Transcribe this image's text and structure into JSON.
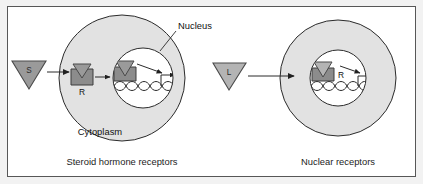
{
  "figure": {
    "background_color": "#ffffff",
    "frame_color": "#575757",
    "outer_margin_color": "#f2f2f2"
  },
  "colors": {
    "cytoplasm_fill": "#e2e2e2",
    "nucleus_fill": "#ffffff",
    "ligand_s_fill": "#9a9a9a",
    "ligand_l_fill": "#b4b4b4",
    "receptor_fill": "#8c8c8c",
    "outline": "#2b2b2b",
    "text": "#111111"
  },
  "panels": [
    {
      "id": "steroid-panel",
      "caption": "Steroid hormone receptors",
      "ligand": {
        "label": "S",
        "name": "steroid-hormone-ligand",
        "shape": "down-triangle",
        "fill": "#9a9a9a"
      },
      "cell": {
        "cytoplasm_label": "Cytoplasm",
        "nucleus_label": "Nucleus",
        "nucleus_leader_line": true
      },
      "cytoplasmic_receptor": {
        "label": "R",
        "name": "cytoplasmic-receptor",
        "bound": true
      },
      "nuclear_complex": {
        "label": "",
        "name": "nuclear-receptor-dna-complex",
        "bound_to_dna": true
      },
      "dna": {
        "name": "dna-double-helix",
        "turns": 5
      },
      "arrows": [
        {
          "name": "ligand-entry-arrow",
          "from": "ligand",
          "to": "cytoplasmic-receptor"
        },
        {
          "name": "translocation-arrow",
          "from": "cytoplasmic-receptor",
          "to": "nucleus"
        },
        {
          "name": "transcription-diagonal-arrow",
          "from": "complex",
          "to": "gene"
        },
        {
          "name": "transcription-start-arrow",
          "from": "dna",
          "to": "transcript"
        }
      ]
    },
    {
      "id": "nuclear-panel",
      "caption": "Nuclear receptors",
      "ligand": {
        "label": "L",
        "name": "nuclear-receptor-ligand",
        "shape": "down-triangle",
        "fill": "#b4b4b4"
      },
      "cell": {
        "cytoplasm_label": "",
        "nucleus_label": "",
        "nucleus_leader_line": false
      },
      "nuclear_complex": {
        "label": "R",
        "name": "nuclear-receptor",
        "bound_to_dna": true
      },
      "dna": {
        "name": "dna-double-helix",
        "turns": 5
      },
      "arrows": [
        {
          "name": "ligand-entry-arrow",
          "from": "ligand",
          "to": "nucleus"
        },
        {
          "name": "transcription-diagonal-arrow",
          "from": "complex",
          "to": "gene"
        },
        {
          "name": "transcription-start-arrow",
          "from": "dna",
          "to": "transcript"
        }
      ]
    }
  ],
  "labels": {
    "nucleus": "Nucleus",
    "cytoplasm": "Cytoplasm",
    "receptor_left": "R",
    "receptor_right": "R",
    "ligand_left": "S",
    "ligand_right": "L",
    "caption_left": "Steroid hormone receptors",
    "caption_right": "Nuclear receptors"
  }
}
